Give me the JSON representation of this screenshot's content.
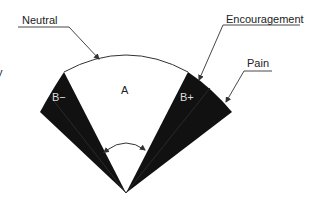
{
  "diagram": {
    "type": "fan-sector",
    "colors": {
      "background": "#ffffff",
      "wedge_fill": "#111111",
      "wedge_inner_text": "#dddddd",
      "line": "#333333",
      "text": "#222222"
    },
    "regions": {
      "center": {
        "label": "A"
      },
      "left_wedge": {
        "label": "B−"
      },
      "right_wedge": {
        "label": "B+"
      }
    },
    "callouts": {
      "neutral": {
        "label": "Neutral"
      },
      "encouragement": {
        "label": "Encouragement"
      },
      "pain": {
        "label": "Pain"
      }
    },
    "edge_fragments": {
      "left_glyph": "y"
    }
  }
}
